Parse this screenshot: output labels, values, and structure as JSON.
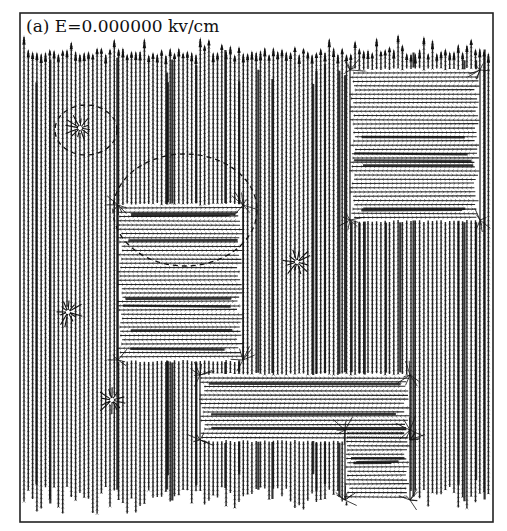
{
  "panel": {
    "label": "(a) E=0.000000 kv/cm",
    "field_value": "0.000000",
    "field_unit": "kv/cm",
    "subfigure": "(a)"
  },
  "frame": {
    "x": 20,
    "y": 13,
    "width": 473,
    "height": 509,
    "stroke": "#222222"
  },
  "colors": {
    "ink": "#111111",
    "background": "#ffffff"
  },
  "field": {
    "column_spacing": 4.3,
    "row_spacing": 8.5,
    "background_direction": "up",
    "top_margin": 48,
    "bottom_margin": 505
  },
  "domains": [
    {
      "name": "upper-right-horizontal-domain",
      "x": 350,
      "y": 70,
      "w": 130,
      "h": 150
    },
    {
      "name": "left-center-horizontal-domain",
      "x": 118,
      "y": 205,
      "w": 125,
      "h": 155
    },
    {
      "name": "lower-center-horizontal-domain",
      "x": 200,
      "y": 375,
      "w": 210,
      "h": 65
    },
    {
      "name": "lower-right-horizontal-domain",
      "x": 345,
      "y": 430,
      "w": 65,
      "h": 70
    }
  ],
  "vortices": [
    {
      "name": "small-vortex",
      "x": 80,
      "y": 128
    },
    {
      "name": "center-vortex",
      "x": 297,
      "y": 262
    },
    {
      "name": "left-vortex",
      "x": 68,
      "y": 312
    },
    {
      "name": "lower-left-vortex",
      "x": 112,
      "y": 400
    }
  ],
  "dashed_ellipses": [
    {
      "name": "small-dashed-ellipse",
      "cx": 86,
      "cy": 130,
      "rx": 31,
      "ry": 25
    },
    {
      "name": "large-dashed-ellipse",
      "cx": 185,
      "cy": 210,
      "rx": 72,
      "ry": 56
    }
  ]
}
